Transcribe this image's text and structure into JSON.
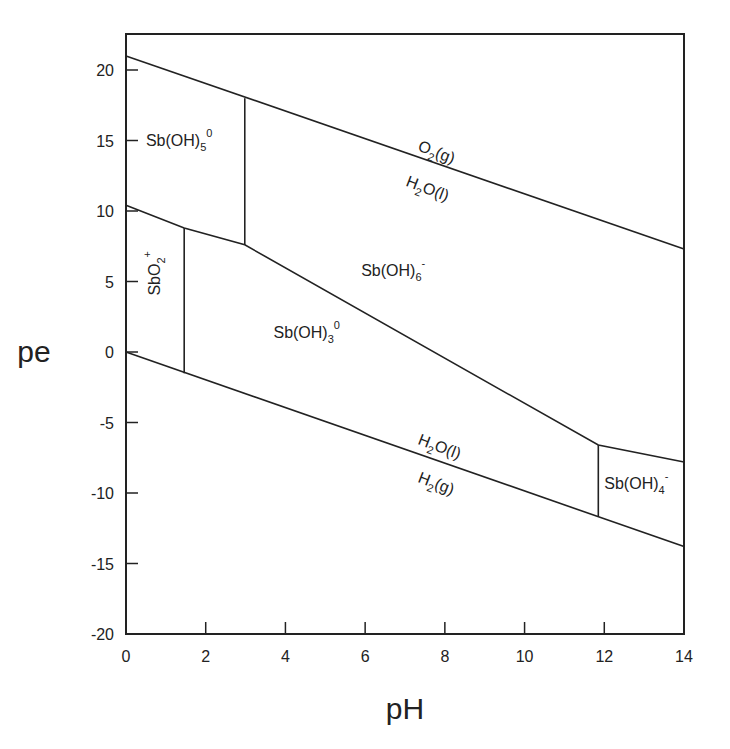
{
  "chart_data": {
    "type": "line",
    "title": "",
    "xlabel": "pH",
    "ylabel": "pe",
    "xlim": [
      0,
      14
    ],
    "ylim": [
      -20,
      22.6
    ],
    "xticks": [
      0,
      2,
      4,
      6,
      8,
      10,
      12,
      14
    ],
    "yticks": [
      -20,
      -15,
      -10,
      -5,
      0,
      5,
      10,
      15,
      20
    ],
    "grid": false,
    "legend": "none",
    "series": [
      {
        "name": "O2(g)/H2O(l) boundary",
        "x": [
          0,
          14
        ],
        "y": [
          21.0,
          7.3
        ]
      },
      {
        "name": "H2O(l)/H2(g) boundary",
        "x": [
          0,
          14
        ],
        "y": [
          0.0,
          -13.8
        ]
      },
      {
        "name": "Sb(V)/Sb(III) upper boundary",
        "x": [
          0,
          1.46,
          2.98,
          11.85,
          14
        ],
        "y": [
          10.4,
          8.8,
          7.6,
          -6.6,
          -7.8
        ]
      },
      {
        "name": "Sb(OH)5/Sb(OH)6- boundary",
        "x": [
          2.98,
          2.98
        ],
        "y": [
          18.0,
          7.6
        ]
      },
      {
        "name": "SbO2+/Sb(OH)3 boundary",
        "x": [
          1.46,
          1.46
        ],
        "y": [
          8.8,
          -1.5
        ]
      },
      {
        "name": "Sb(OH)3/Sb(OH)4- boundary",
        "x": [
          11.85,
          11.85
        ],
        "y": [
          -6.6,
          -11.7
        ]
      }
    ],
    "annotations": [
      {
        "text": "Sb(OH)5^0",
        "base": "Sb(OH)",
        "sub": "5",
        "sup": "0",
        "x": 0.5,
        "y": 14.6,
        "rotate": 0
      },
      {
        "text": "O2(g)",
        "base": "O",
        "sub": "2",
        "tail": "(g)",
        "x": 7.3,
        "y": 14.3,
        "rotate": 21
      },
      {
        "text": "H2O(l)",
        "base": "H",
        "sub": "2",
        "tail": "O(l)",
        "x": 7.0,
        "y": 11.8,
        "rotate": 21
      },
      {
        "text": "Sb(OH)6^-",
        "base": "Sb(OH)",
        "sub": "6",
        "sup": "-",
        "x": 5.9,
        "y": 5.4,
        "rotate": 0
      },
      {
        "text": "SbO2^+",
        "base": "SbO",
        "sub": "2",
        "sup": "+",
        "x": 0.85,
        "y": 4.0,
        "rotate": -90
      },
      {
        "text": "Sb(OH)3^0",
        "base": "Sb(OH)",
        "sub": "3",
        "sup": "0",
        "x": 3.7,
        "y": 1.0,
        "rotate": 0
      },
      {
        "text": "H2O(l)",
        "base": "H",
        "sub": "2",
        "tail": "O(l)",
        "x": 7.3,
        "y": -6.5,
        "rotate": 21
      },
      {
        "text": "H2(g)",
        "base": "H",
        "sub": "2",
        "tail": "(g)",
        "x": 7.3,
        "y": -9.2,
        "rotate": 21
      },
      {
        "text": "Sb(OH)4^-",
        "base": "Sb(OH)",
        "sub": "4",
        "sup": "-",
        "x": 12.0,
        "y": -9.7,
        "rotate": 0
      }
    ]
  }
}
